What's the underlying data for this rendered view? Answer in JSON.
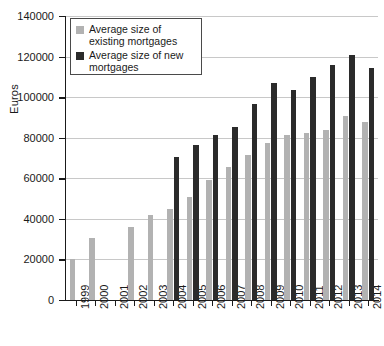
{
  "chart_data": {
    "type": "bar",
    "title": "",
    "subtitle": "",
    "xlabel": "",
    "ylabel": "Euros",
    "ylim": [
      0,
      140000
    ],
    "ytick_values": [
      0,
      20000,
      40000,
      60000,
      80000,
      100000,
      120000,
      140000
    ],
    "ytick_labels": [
      "0",
      "20000",
      "40000",
      "60000",
      "80000",
      "100000",
      "120000",
      "140000"
    ],
    "grid": "horizontal",
    "legend_position": "top-left-inside",
    "categories": [
      "1999",
      "2000",
      "2001",
      "2002",
      "2003",
      "2004",
      "2005",
      "2006",
      "2007",
      "2008",
      "2009",
      "2010",
      "2011",
      "2012",
      "2013",
      "2014"
    ],
    "series": [
      {
        "name": "Average size of existing mortgages",
        "color": "#b2b2b2",
        "values": [
          20000,
          30500,
          null,
          36000,
          42000,
          45000,
          51000,
          59000,
          65500,
          71500,
          77500,
          81500,
          82500,
          84000,
          90500,
          88000
        ]
      },
      {
        "name": "Average size of new mortgages",
        "color": "#2b2b2b",
        "values": [
          null,
          null,
          null,
          null,
          null,
          70500,
          76500,
          81500,
          85500,
          96500,
          107000,
          103500,
          110000,
          116000,
          121000,
          114500
        ]
      }
    ]
  },
  "legend": {
    "entries": [
      {
        "label": "Average size of existing mortgages",
        "swatch": "legend-swatch-existing"
      },
      {
        "label": "Average size of new mortgages",
        "swatch": "legend-swatch-new"
      }
    ]
  },
  "colors": {
    "existing": "#b2b2b2",
    "new": "#2b2b2b",
    "axis": "#1a1a1a",
    "gridline": "#c8c8c8",
    "background": "#ffffff"
  }
}
